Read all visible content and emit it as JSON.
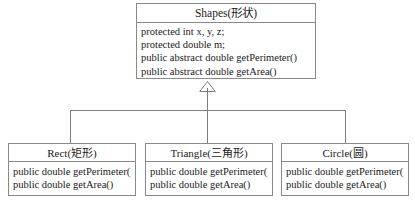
{
  "diagram": {
    "type": "uml-class-diagram",
    "relationship": "generalization",
    "background_color": "#ffffff",
    "line_color": "#7d7d7d",
    "border_color": "#8a8a8a",
    "text_color": "#1a1a1a"
  },
  "superclass": {
    "name": "Shapes(形状)",
    "members": [
      "protected int x, y, z;",
      "protected double m;",
      "public abstract double getPerimeter()",
      "public abstract double getArea()"
    ]
  },
  "subclasses": [
    {
      "name": "Rect(矩形)",
      "members": [
        "public double getPerimeter()",
        "public double getArea()"
      ]
    },
    {
      "name": "Triangle(三角形)",
      "members": [
        "public double getPerimeter()",
        "public double getArea()"
      ]
    },
    {
      "name": "Circle(圆)",
      "members": [
        "public double getPerimeter()",
        "public double getArea()"
      ]
    }
  ],
  "connector": {
    "arrowhead": "hollow-triangle-inheritance-arrow"
  }
}
